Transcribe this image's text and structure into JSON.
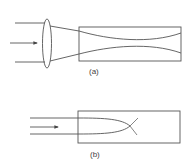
{
  "figure": {
    "panel_a": {
      "label": "(a)",
      "description": "Parallel beam focused by lens into a waveguide, forming a beam waist"
    },
    "panel_b": {
      "label": "(b)",
      "description": "Parallel beam entering a medium and self-focusing to a crossing point"
    },
    "colors": {
      "stroke": "#555555",
      "background": "#ffffff"
    }
  }
}
